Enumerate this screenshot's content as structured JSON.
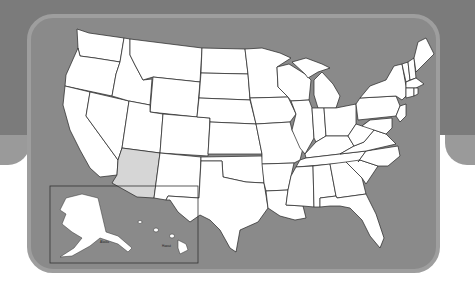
{
  "map": {
    "title": "United States map",
    "highlighted_state": "Arizona",
    "highlight_color": "#d6d6d6",
    "state_fill": "#ffffff",
    "water_color": "#8a8a8a",
    "border_color": "#9e9e9e",
    "background_color": "#7b7b7b"
  },
  "inset": {
    "alaska_label": "Alaska",
    "hawaii_label": "Hawaii"
  }
}
